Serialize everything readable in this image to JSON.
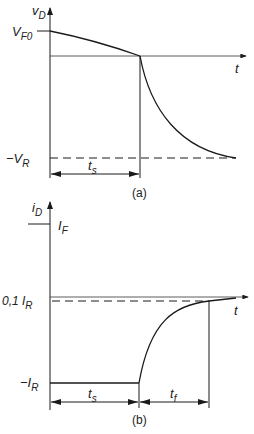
{
  "diagram_a": {
    "y_label": "v",
    "y_label_sub": "D",
    "x_label": "t",
    "level_top": "V",
    "level_top_sub": "F0",
    "level_bottom": "−V",
    "level_bottom_sub": "R",
    "interval": "t",
    "interval_sub": "s",
    "caption": "(a)"
  },
  "diagram_b": {
    "y_label": "i",
    "y_label_sub": "D",
    "x_label": "t",
    "level_forward": "I",
    "level_forward_sub": "F",
    "level_threshold": "0,1 I",
    "level_threshold_sub": "R",
    "level_reverse": "−I",
    "level_reverse_sub": "R",
    "interval_storage": "t",
    "interval_storage_sub": "s",
    "interval_fall": "t",
    "interval_fall_sub": "f",
    "caption": "(b)"
  },
  "colors": {
    "ink": "#1a1a1a",
    "background": "#ffffff"
  }
}
